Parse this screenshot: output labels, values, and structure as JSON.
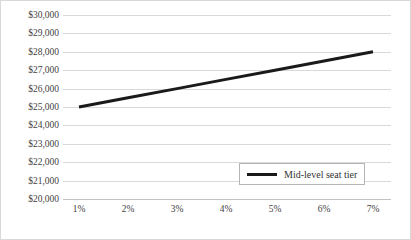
{
  "chart_data": {
    "type": "line",
    "title": "",
    "xlabel": "",
    "ylabel": "",
    "x": [
      "1%",
      "2%",
      "3%",
      "4%",
      "5%",
      "6%",
      "7%"
    ],
    "series": [
      {
        "name": "Mid-level seat tier",
        "values": [
          25000,
          25500,
          26000,
          26500,
          27000,
          27500,
          28000
        ],
        "color": "#1a1a1a"
      }
    ],
    "ylim": [
      20000,
      30000
    ],
    "ytick_values": [
      30000,
      29000,
      28000,
      27000,
      26000,
      25000,
      24000,
      23000,
      22000,
      21000,
      20000
    ],
    "ytick_labels": [
      "$30,000",
      "$29,000",
      "$28,000",
      "$27,000",
      "$26,000",
      "$25,000",
      "$24,000",
      "$23,000",
      "$22,000",
      "$21,000",
      "$20,000"
    ],
    "xtick_labels": [
      "1%",
      "2%",
      "3%",
      "4%",
      "5%",
      "6%",
      "7%"
    ],
    "grid": true,
    "grid_axis": "y",
    "grid_color": "#d9d9d9",
    "legend": {
      "position": "inside-bottom-right",
      "entries": [
        {
          "label": "Mid-level seat tier",
          "color": "#1a1a1a",
          "marker": "line"
        }
      ]
    },
    "annotations": []
  }
}
